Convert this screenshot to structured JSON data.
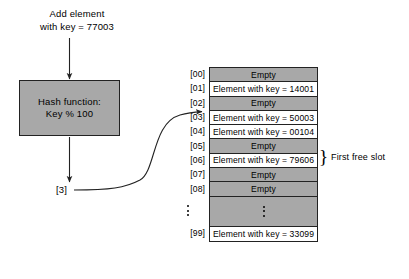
{
  "diagram": {
    "title_lines": [
      "Add element",
      "with key = 77003"
    ],
    "hash_box": {
      "line1": "Hash function:",
      "line2": "Key % 100"
    },
    "result_index": "[3]",
    "annotation": "First free slot",
    "brace_glyph": "}",
    "colors": {
      "empty_cell": "#a8a8a8",
      "filled_cell": "#ffffff",
      "border": "#222222",
      "background": "#ffffff"
    },
    "table": {
      "rows": [
        {
          "index": "[00]",
          "text": "Empty",
          "state": "empty"
        },
        {
          "index": "[01]",
          "text": "Element with key = 14001",
          "state": "filled"
        },
        {
          "index": "[02]",
          "text": "Empty",
          "state": "empty"
        },
        {
          "index": "[03]",
          "text": "Element with key = 50003",
          "state": "filled"
        },
        {
          "index": "[04]",
          "text": "Element with key = 00104",
          "state": "filled"
        },
        {
          "index": "[05]",
          "text": "Empty",
          "state": "empty"
        },
        {
          "index": "[06]",
          "text": "Element with key = 79606",
          "state": "filled"
        },
        {
          "index": "[07]",
          "text": "Empty",
          "state": "empty"
        },
        {
          "index": "[08]",
          "text": "Empty",
          "state": "empty"
        },
        {
          "index": "",
          "text": "",
          "state": "ellipsis"
        },
        {
          "index": "[99]",
          "text": "Element with key = 33099",
          "state": "filled"
        }
      ]
    }
  }
}
